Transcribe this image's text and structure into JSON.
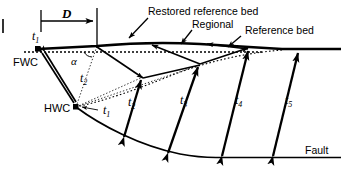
{
  "figure": {
    "type": "structural-geology-cross-section",
    "width": 343,
    "height": 169,
    "background_color": "#ffffff",
    "line_color": "#000000"
  },
  "labels": {
    "displacement": "D",
    "fwc": "FWC",
    "hwc": "HWC",
    "alpha": "α",
    "restored_reference_bed": "Restored reference bed",
    "regional": "Regional",
    "reference_bed": "Reference bed",
    "fault": "Fault"
  },
  "throw_labels": [
    {
      "id": "t1-top",
      "base": "t",
      "sub": "1",
      "x": 32,
      "y": 40
    },
    {
      "id": "t2-upper",
      "base": "t",
      "sub": "2",
      "x": 80,
      "y": 82
    },
    {
      "id": "t1-hwc",
      "base": "t",
      "sub": "1",
      "x": 103,
      "y": 114
    },
    {
      "id": "t2-arrow",
      "base": "t",
      "sub": "2",
      "x": 128,
      "y": 106
    },
    {
      "id": "t3-arrow",
      "base": "t",
      "sub": "3",
      "x": 180,
      "y": 104
    },
    {
      "id": "t4-arrow",
      "base": "t",
      "sub": "4",
      "x": 235,
      "y": 104
    },
    {
      "id": "t5-arrow",
      "base": "t",
      "sub": "5",
      "x": 285,
      "y": 104
    }
  ],
  "key_points": {
    "fwc": {
      "x": 38,
      "y": 49
    },
    "hwc": {
      "x": 76,
      "y": 107
    }
  }
}
